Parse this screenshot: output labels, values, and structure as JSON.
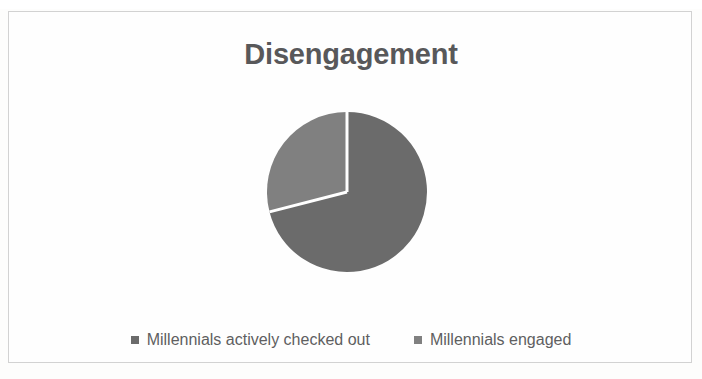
{
  "figure": {
    "title": "Disengagement",
    "frame_border_color": "#d2d2d2",
    "background_color": "#fefefe",
    "title_color": "#58585a"
  },
  "legend": {
    "position": "bottom",
    "entries": [
      {
        "label": "Millennials actively checked out",
        "marker": "legend-swatch-square",
        "color": "#6b6b6b"
      },
      {
        "label": "Millennials engaged",
        "marker": "legend-swatch-square",
        "color": "#808080"
      }
    ]
  },
  "chart_data": {
    "type": "pie",
    "title": "Disengagement",
    "xlabel": "",
    "ylabel": "",
    "categories": [
      "Millennials actively checked out",
      "Millennials engaged"
    ],
    "values": [
      71,
      29
    ],
    "units": "percent",
    "colors": [
      "#6b6b6b",
      "#808080"
    ],
    "slice_separator_color": "#ffffff",
    "start_angle_deg": 0,
    "direction": "clockwise",
    "data_labels_shown": false,
    "grid": false,
    "legend_position": "bottom",
    "center": {
      "x": 348,
      "y": 192
    },
    "radius": 80
  }
}
